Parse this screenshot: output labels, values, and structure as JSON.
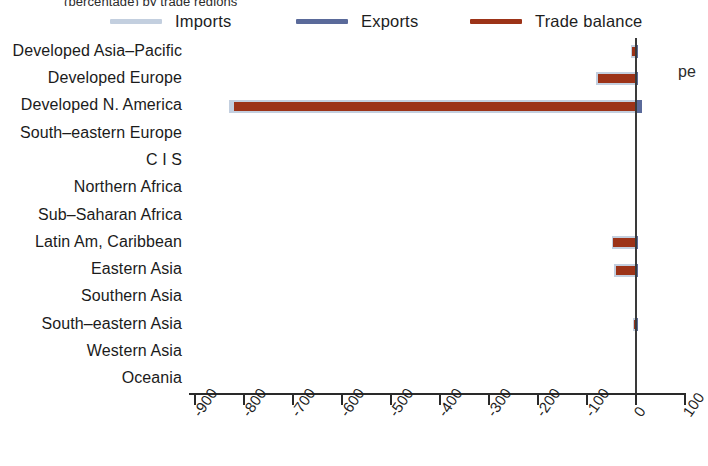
{
  "figure": {
    "clipped_header": "(percentage) by trade regions",
    "clipped_right_note": "pe"
  },
  "legend": {
    "position": "top",
    "items": [
      {
        "label": "Imports",
        "color": "#c3cfdf"
      },
      {
        "label": "Exports",
        "color": "#5a6a9a"
      },
      {
        "label": "Trade balance",
        "color": "#9c3318"
      }
    ]
  },
  "axis": {
    "x_ticks": [
      "-900",
      "-800",
      "-700",
      "-600",
      "-500",
      "-400",
      "-300",
      "-200",
      "-100",
      "0",
      "100"
    ],
    "x_tick_values": [
      -900,
      -800,
      -700,
      -600,
      -500,
      -400,
      -300,
      -200,
      -100,
      0,
      100
    ],
    "x_min": -900,
    "x_max": 100,
    "xlabel": "",
    "ylabel": ""
  },
  "chart_data": {
    "type": "bar",
    "orientation": "horizontal",
    "title": "",
    "subtitle": "",
    "xlabel": "",
    "ylabel": "",
    "xlim": [
      -900,
      100
    ],
    "grid": false,
    "legend_position": "top",
    "categories": [
      "Developed Asia–Pacific",
      "Developed Europe",
      "Developed N. America",
      "South–eastern Europe",
      "C I S",
      "Northern Africa",
      "Sub–Saharan Africa",
      "Latin Am, Caribbean",
      "Eastern Asia",
      "Southern Asia",
      "South–eastern Asia",
      "Western Asia",
      "Oceania"
    ],
    "series": [
      {
        "name": "Imports",
        "color": "#c3cfdf",
        "values": [
          -10,
          -82,
          -832,
          0,
          0,
          0,
          0,
          -50,
          -44,
          0,
          -6,
          0,
          0
        ]
      },
      {
        "name": "Exports",
        "color": "#5a6a9a",
        "values": [
          4,
          4,
          12,
          0,
          0,
          0,
          0,
          3,
          3,
          0,
          2,
          0,
          0
        ]
      },
      {
        "name": "Trade balance",
        "color": "#9c3318",
        "values": [
          -8,
          -78,
          -822,
          0,
          0,
          0,
          0,
          -47,
          -41,
          0,
          -5,
          0,
          0
        ]
      }
    ]
  }
}
